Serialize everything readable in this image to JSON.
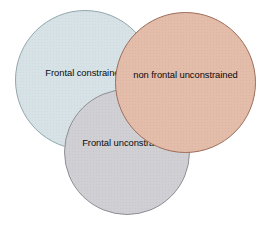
{
  "diagram": {
    "type": "venn",
    "title": "",
    "background_color": "#ffffff",
    "width": 260,
    "height": 228,
    "sets": [
      {
        "id": "frontal-constrained",
        "label": "Frontal constrained",
        "fill_color": "#d6e2e5",
        "stroke_color": "#93a7ad",
        "center_x": 85,
        "center_y": 80,
        "radius": 70,
        "z": 1
      },
      {
        "id": "frontal-unconstrained",
        "label": "Frontal unconstrained",
        "fill_color": "#cfcfd4",
        "stroke_color": "#8e8e96",
        "center_x": 127,
        "center_y": 152,
        "radius": 63,
        "z": 2
      },
      {
        "id": "non-frontal-unconstrained",
        "label": "non frontal unconstrained",
        "fill_color": "#e3bcaa",
        "stroke_color": "#9d6f5c",
        "center_x": 185,
        "center_y": 82,
        "radius": 70,
        "z": 3
      }
    ],
    "label_color": "#0a0a0a"
  }
}
